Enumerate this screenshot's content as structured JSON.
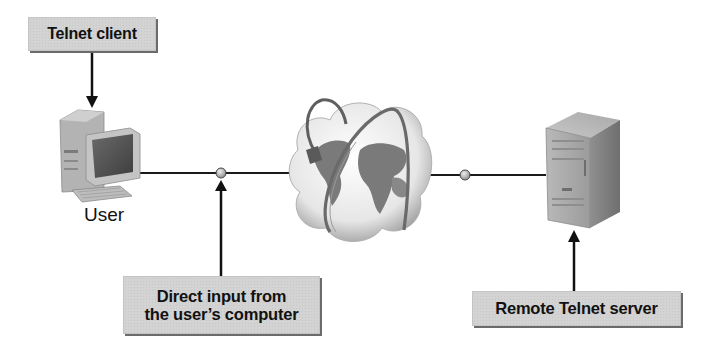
{
  "diagram": {
    "labels": {
      "telnet_client": "Telnet client",
      "user": "User",
      "direct_input": [
        "Direct input from",
        "the user’s computer"
      ],
      "remote_server": "Remote Telnet server"
    },
    "nodes": [
      {
        "id": "user-computer",
        "icon": "desktop-computer-icon",
        "label": "User"
      },
      {
        "id": "internet",
        "icon": "globe-cloud-icon",
        "label": ""
      },
      {
        "id": "telnet-server",
        "icon": "server-tower-icon",
        "label": ""
      }
    ],
    "connections": [
      {
        "from": "user-computer",
        "to": "internet",
        "junction": "user-side-junction"
      },
      {
        "from": "internet",
        "to": "telnet-server",
        "junction": "server-side-junction"
      }
    ],
    "callouts": [
      {
        "label_key": "telnet_client",
        "points_to": "user-computer",
        "arrow": "down"
      },
      {
        "label_key": "direct_input",
        "points_to": "user-side-junction",
        "arrow": "up"
      },
      {
        "label_key": "remote_server",
        "points_to": "telnet-server",
        "arrow": "up"
      }
    ],
    "colors": {
      "box_fill": "#d3d3d3",
      "box_shadow": "#6b6b6b",
      "line": "#1a1a1a",
      "device_gray": "#a9a9a9"
    }
  }
}
